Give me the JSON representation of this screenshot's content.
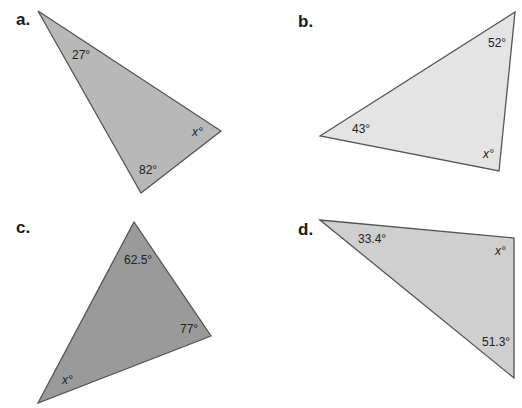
{
  "problems": [
    {
      "label": "a.",
      "angles": [
        "27°",
        "x°",
        "82°"
      ],
      "fill": "#b8b8b8"
    },
    {
      "label": "b.",
      "angles": [
        "52°",
        "43°",
        "x°"
      ],
      "fill": "#e4e4e4"
    },
    {
      "label": "c.",
      "angles": [
        "62.5°",
        "77°",
        "x°"
      ],
      "fill": "#9a9a9a"
    },
    {
      "label": "d.",
      "angles": [
        "33.4°",
        "x°",
        "51.3°"
      ],
      "fill": "#cfcfcf"
    }
  ],
  "stroke": "#555555"
}
